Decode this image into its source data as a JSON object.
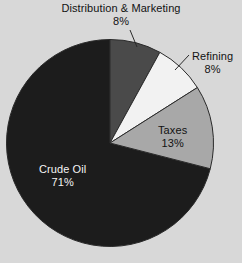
{
  "chart_data": {
    "type": "pie",
    "title": "",
    "categories": [
      "Distribution & Marketing",
      "Refining",
      "Taxes",
      "Crude Oil"
    ],
    "values": [
      8,
      8,
      13,
      71
    ],
    "value_labels": [
      "8%",
      "8%",
      "13%",
      "71%"
    ],
    "unit": "%",
    "start_angle_deg": 0,
    "direction": "clockwise",
    "legend": "none",
    "grid": false,
    "slices": [
      {
        "name": "Distribution & Marketing",
        "value": 8,
        "value_label": "8%",
        "color": "#4a4a4a",
        "label_position": "outside",
        "leader_line": true,
        "text_color": "#121212"
      },
      {
        "name": "Refining",
        "value": 8,
        "value_label": "8%",
        "color": "#f2f2f2",
        "label_position": "outside",
        "leader_line": true,
        "text_color": "#121212"
      },
      {
        "name": "Taxes",
        "value": 13,
        "value_label": "13%",
        "color": "#a8a8a8",
        "label_position": "inside",
        "leader_line": false,
        "text_color": "#121212"
      },
      {
        "name": "Crude Oil",
        "value": 71,
        "value_label": "71%",
        "color": "#1c1c1c",
        "label_position": "inside",
        "leader_line": false,
        "text_color": "#f4f4f4"
      }
    ]
  },
  "canvas": {
    "background_color": "#d8d8d8",
    "outline_color": "#2a2a2a"
  }
}
